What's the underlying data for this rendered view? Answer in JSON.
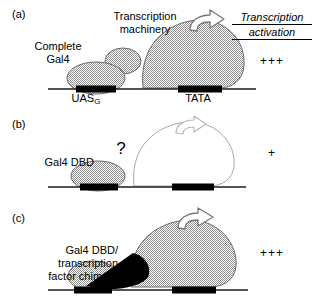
{
  "figure": {
    "type": "diagram",
    "right_column": {
      "header_line1": "Transcription",
      "header_line2": "activation"
    }
  },
  "panels": [
    {
      "id": "a",
      "label": "(a)",
      "protein_label": "Complete\nGal4",
      "protein_label_line1": "Complete",
      "protein_label_line2": "Gal4",
      "machinery_label_line1": "Transcription",
      "machinery_label_line2": "machinery",
      "dna_site_label": "UAS",
      "dna_site_subscript": "G",
      "promoter_label": "TATA",
      "activation_score": "+++",
      "machinery_filled": true,
      "arrow_style": "solid-outline",
      "has_question_mark": false,
      "has_chimera_wedge": false
    },
    {
      "id": "b",
      "label": "(b)",
      "protein_label": "Gal4 DBD",
      "question_mark": "?",
      "activation_score": "+",
      "machinery_filled": false,
      "arrow_style": "faint-outline",
      "has_question_mark": true,
      "has_chimera_wedge": false
    },
    {
      "id": "c",
      "label": "(c)",
      "protein_label_line1": "Gal4 DBD/",
      "protein_label_line2": "transcription",
      "protein_label_line3": "factor chimera",
      "activation_score": "+++",
      "machinery_filled": true,
      "arrow_style": "solid-outline",
      "has_question_mark": false,
      "has_chimera_wedge": true
    }
  ],
  "colors": {
    "ink": "#000000",
    "dither_gray": "#9a9a9a",
    "faint_outline": "#b8b8b8",
    "dna_line": "#1a1a1a",
    "box_black": "#000000"
  }
}
